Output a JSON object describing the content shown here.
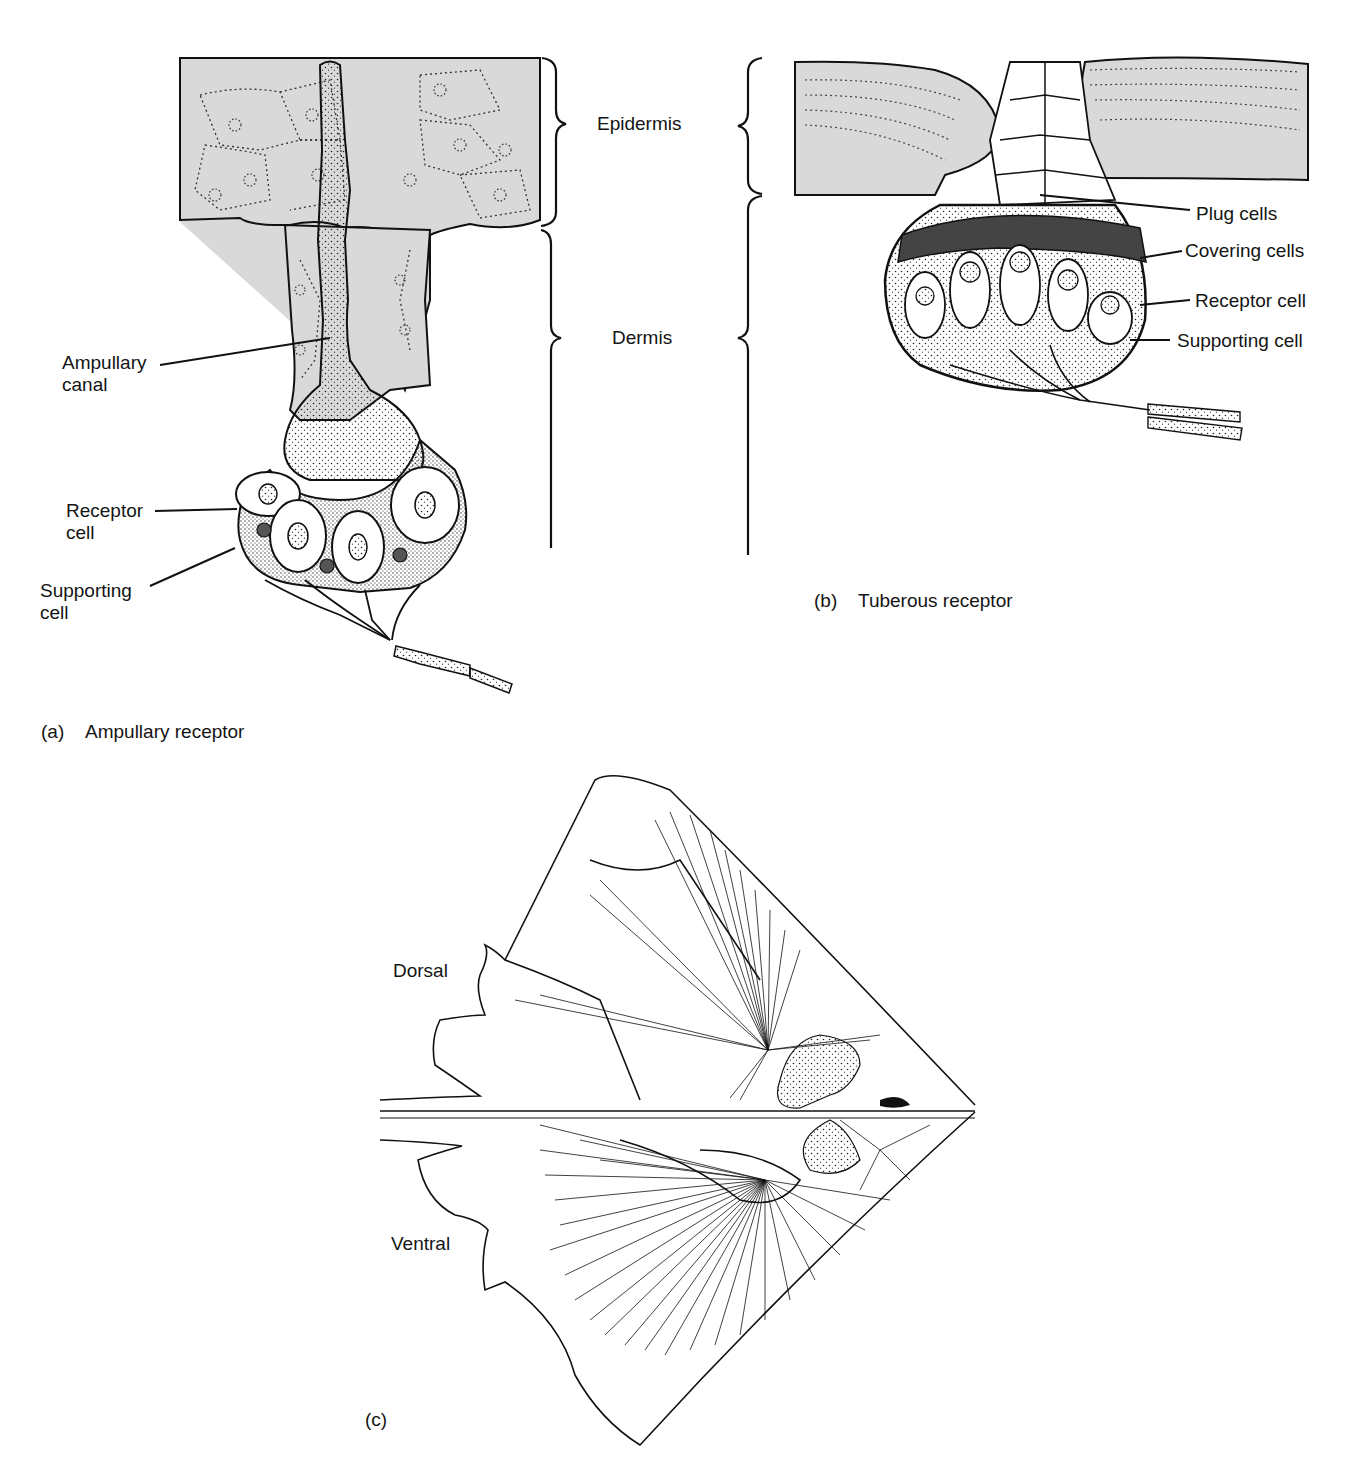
{
  "figure": {
    "panels": [
      {
        "id": "a",
        "tag": "(a)",
        "title": "Ampullary receptor",
        "labels": {
          "ampullary_canal": "Ampullary canal",
          "receptor_cell": "Receptor cell",
          "supporting_cell": "Supporting cell"
        }
      },
      {
        "id": "b",
        "tag": "(b)",
        "title": "Tuberous receptor",
        "labels": {
          "plug_cells": "Plug cells",
          "covering_cells": "Covering cells",
          "receptor_cell": "Receptor cell",
          "supporting_cell": "Supporting cell"
        }
      },
      {
        "id": "c",
        "tag": "(c)",
        "title": "",
        "labels": {
          "dorsal": "Dorsal",
          "ventral": "Ventral"
        }
      }
    ],
    "layers": {
      "epidermis": "Epidermis",
      "dermis": "Dermis"
    },
    "colors": {
      "tissue_gray": "#d9d9d9",
      "covering_cells": "#444444",
      "line": "#111111",
      "background": "#ffffff"
    }
  }
}
